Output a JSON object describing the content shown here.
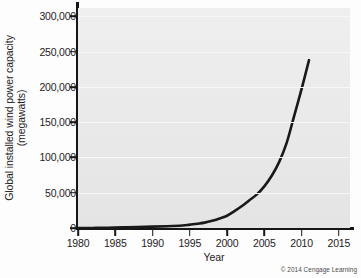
{
  "chart_data": {
    "type": "line",
    "title": "",
    "xlabel": "Year",
    "ylabel": "Global installed wind power capacity (megawatts)",
    "ylabel_line1": "Global installed wind power capacity",
    "ylabel_line2": "(megawatts)",
    "xlim": [
      1980,
      2016.5
    ],
    "ylim": [
      0,
      312000
    ],
    "xticks": [
      1980,
      1985,
      1990,
      1995,
      2000,
      2005,
      2010,
      2015
    ],
    "xtick_labels": [
      "1980",
      "1985",
      "1990",
      "1995",
      "2000",
      "2005",
      "2010",
      "2015"
    ],
    "yticks": [
      0,
      50000,
      100000,
      150000,
      200000,
      250000,
      300000
    ],
    "ytick_labels": [
      "0",
      "50,000",
      "100,000",
      "150,000",
      "200,000",
      "250,000",
      "300,000"
    ],
    "grid": "horizontal",
    "legend": "none",
    "series": [
      {
        "name": "Global installed wind power capacity",
        "color": "#191919",
        "x": [
          1980,
          1982,
          1984,
          1986,
          1988,
          1990,
          1992,
          1994,
          1995,
          1996,
          1997,
          1998,
          1999,
          2000,
          2001,
          2002,
          2003,
          2004,
          2005,
          2006,
          2007,
          2008,
          2009,
          2010,
          2011
        ],
        "values": [
          0,
          90,
          300,
          900,
          1500,
          1930,
          2500,
          3500,
          4800,
          6100,
          7600,
          10200,
          13600,
          17400,
          23900,
          31100,
          39431,
          47620,
          59091,
          74052,
          93820,
          120690,
          158700,
          197000,
          238000
        ]
      }
    ],
    "annotations": [],
    "credit": "© 2014 Cengage Learning"
  }
}
